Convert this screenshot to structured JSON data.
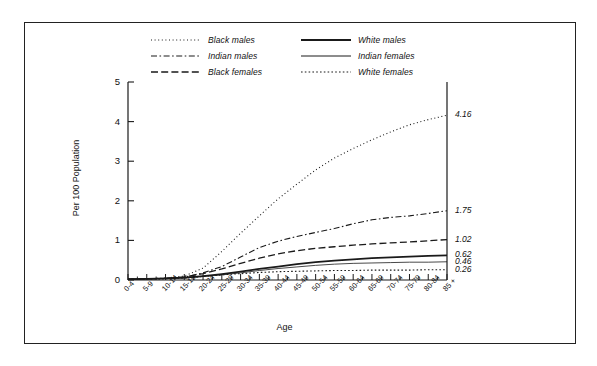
{
  "chart_data": {
    "type": "line",
    "title": "",
    "xlabel": "Age",
    "ylabel": "Per 100 Population",
    "ylim": [
      0,
      5
    ],
    "yticks": [
      "0",
      "1",
      "2",
      "3",
      "4",
      "5"
    ],
    "grid": false,
    "legend_position": "top-center",
    "categories": [
      "0-4",
      "5-9",
      "10-14",
      "15-19",
      "20-24",
      "25-29",
      "30-34",
      "35-39",
      "40-44",
      "45-49",
      "50-54",
      "55-59",
      "60-64",
      "65-69",
      "70-74",
      "75-79",
      "80-84",
      "85 +"
    ],
    "series": [
      {
        "name": "Black males",
        "style": "dotted",
        "width": 1.1,
        "end_label": "4.16",
        "values": [
          0.02,
          0.03,
          0.05,
          0.1,
          0.3,
          0.72,
          1.18,
          1.62,
          2.05,
          2.42,
          2.78,
          3.08,
          3.32,
          3.54,
          3.74,
          3.92,
          4.05,
          4.16
        ]
      },
      {
        "name": "Indian males",
        "style": "dash-dot",
        "width": 1.1,
        "end_label": "1.75",
        "values": [
          0.02,
          0.03,
          0.04,
          0.07,
          0.18,
          0.34,
          0.58,
          0.82,
          0.98,
          1.1,
          1.2,
          1.3,
          1.42,
          1.52,
          1.58,
          1.62,
          1.68,
          1.75
        ]
      },
      {
        "name": "Black females",
        "style": "dashed",
        "width": 1.3,
        "end_label": "1.02",
        "values": [
          0.02,
          0.03,
          0.04,
          0.08,
          0.16,
          0.28,
          0.42,
          0.55,
          0.66,
          0.74,
          0.8,
          0.84,
          0.88,
          0.91,
          0.94,
          0.96,
          0.99,
          1.02
        ]
      },
      {
        "name": "White males",
        "style": "solid",
        "width": 1.7,
        "end_label": "0.62",
        "values": [
          0.02,
          0.03,
          0.04,
          0.06,
          0.1,
          0.15,
          0.21,
          0.28,
          0.34,
          0.4,
          0.45,
          0.49,
          0.52,
          0.55,
          0.57,
          0.59,
          0.61,
          0.62
        ]
      },
      {
        "name": "Indian females",
        "style": "solid",
        "width": 0.8,
        "end_label": "0.46",
        "values": [
          0.02,
          0.03,
          0.04,
          0.05,
          0.09,
          0.13,
          0.18,
          0.24,
          0.29,
          0.33,
          0.37,
          0.4,
          0.42,
          0.43,
          0.44,
          0.45,
          0.45,
          0.46
        ]
      },
      {
        "name": "White females",
        "style": "fine-dotted",
        "width": 1.1,
        "end_label": "0.26",
        "values": [
          0.02,
          0.02,
          0.03,
          0.05,
          0.09,
          0.13,
          0.16,
          0.19,
          0.21,
          0.22,
          0.23,
          0.24,
          0.24,
          0.25,
          0.25,
          0.25,
          0.26,
          0.26
        ]
      }
    ],
    "end_labels": [
      "4.16",
      "1.75",
      "1.02",
      "0.62",
      "0.46",
      "0.26"
    ]
  },
  "legend": {
    "items": [
      {
        "label": "Black males",
        "style": "dotted"
      },
      {
        "label": "White males",
        "style": "solid-thick"
      },
      {
        "label": "Indian males",
        "style": "dash-dot"
      },
      {
        "label": "Indian females",
        "style": "solid-thin"
      },
      {
        "label": "Black females",
        "style": "dashed"
      },
      {
        "label": "White females",
        "style": "fine-dotted"
      }
    ]
  },
  "colors": {
    "line": "#1a1a1a",
    "frame": "#222222",
    "background": "#ffffff"
  }
}
